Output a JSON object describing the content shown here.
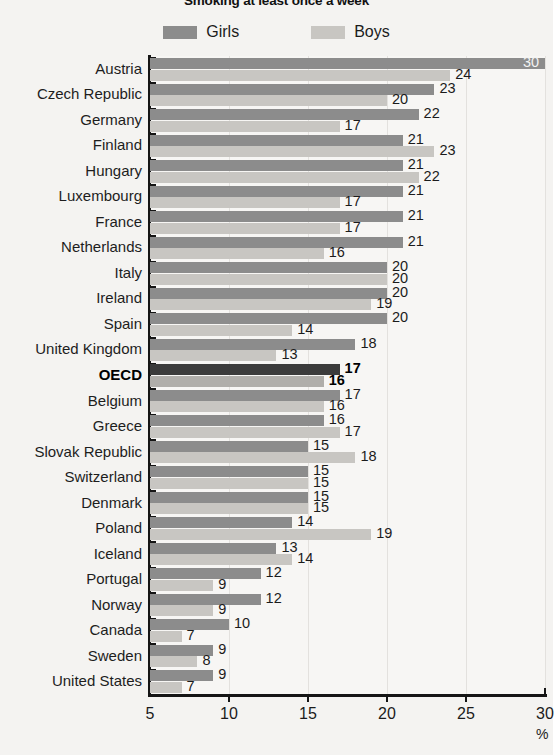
{
  "chart_data": {
    "type": "bar",
    "orientation": "horizontal",
    "title": "Smoking at least once a week",
    "xlabel": "%",
    "ylabel": "",
    "xlim": [
      5,
      30
    ],
    "xticks": [
      5,
      10,
      15,
      20,
      25,
      30
    ],
    "grid": true,
    "legend_position": "top-center",
    "categories": [
      "Austria",
      "Czech Republic",
      "Germany",
      "Finland",
      "Hungary",
      "Luxembourg",
      "France",
      "Netherlands",
      "Italy",
      "Ireland",
      "Spain",
      "United Kingdom",
      "OECD",
      "Belgium",
      "Greece",
      "Slovak Republic",
      "Switzerland",
      "Denmark",
      "Poland",
      "Iceland",
      "Portugal",
      "Norway",
      "Canada",
      "Sweden",
      "United States"
    ],
    "highlight_category": "OECD",
    "series": [
      {
        "name": "Girls",
        "color": "#8c8c8c",
        "highlight_color": "#3b3b3b",
        "values": [
          30,
          23,
          22,
          21,
          21,
          21,
          21,
          21,
          20,
          20,
          20,
          18,
          17,
          17,
          16,
          15,
          15,
          15,
          14,
          13,
          12,
          12,
          10,
          9,
          9
        ]
      },
      {
        "name": "Boys",
        "color": "#c8c6c2",
        "highlight_color": "#b0aeaa",
        "values": [
          24,
          20,
          17,
          23,
          22,
          17,
          17,
          16,
          20,
          19,
          14,
          13,
          16,
          16,
          17,
          18,
          15,
          15,
          19,
          14,
          9,
          9,
          7,
          8,
          7
        ]
      }
    ]
  },
  "legend": {
    "items": [
      {
        "label": "Girls",
        "color": "#8c8c8c"
      },
      {
        "label": "Boys",
        "color": "#c8c6c2"
      }
    ]
  },
  "axis": {
    "x_tick_labels": [
      "5",
      "10",
      "15",
      "20",
      "25",
      "30"
    ],
    "unit": "%"
  }
}
